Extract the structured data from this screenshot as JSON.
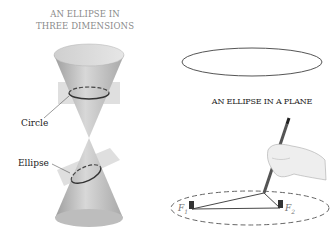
{
  "left_panel": {
    "title_line1": "AN ELLIPSE IN",
    "title_line2": "THREE DIMENSIONS",
    "labels": {
      "circle": "Circle",
      "ellipse": "Ellipse"
    }
  },
  "right_panel": {
    "title": "AN ELLIPSE IN A PLANE",
    "foci": {
      "f1": "F",
      "f1_sub": "1",
      "f2": "F",
      "f2_sub": "2"
    }
  },
  "colors": {
    "cone": "#b8b8b8",
    "plane": "#d6d6d6",
    "curve": "#444444",
    "text": "#222222",
    "title_gray": "#8a8a8a"
  }
}
